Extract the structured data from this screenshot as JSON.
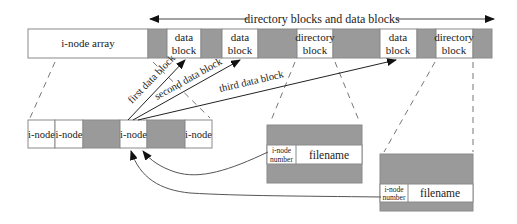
{
  "diagram": {
    "top_arrow_label": "directory blocks and data blocks",
    "colors": {
      "gray_block": "#9a9a9a",
      "stroke": "#7a7a7a",
      "line": "#444444"
    },
    "disk_strip": {
      "segments": [
        {
          "kind": "label",
          "text": "i-node array"
        },
        {
          "kind": "gray"
        },
        {
          "kind": "block",
          "line1": "data",
          "line2": "block"
        },
        {
          "kind": "gray"
        },
        {
          "kind": "block",
          "line1": "data",
          "line2": "block"
        },
        {
          "kind": "gray"
        },
        {
          "kind": "block",
          "line1": "directory",
          "line2": "block"
        },
        {
          "kind": "gray"
        },
        {
          "kind": "block",
          "line1": "data",
          "line2": "block"
        },
        {
          "kind": "gray"
        },
        {
          "kind": "block",
          "line1": "directory",
          "line2": "block"
        },
        {
          "kind": "gray"
        }
      ]
    },
    "inode_array": {
      "cells": [
        "i-node",
        "i-node",
        "",
        "i-node",
        "",
        "i-node"
      ]
    },
    "pointer_labels": {
      "first": "first data block",
      "second": "second data block",
      "third": "third data block"
    },
    "directory_entries": [
      {
        "inode_line1": "i-node",
        "inode_line2": "number",
        "filename": "filename"
      },
      {
        "inode_line1": "i-node",
        "inode_line2": "number",
        "filename": "filename"
      }
    ]
  }
}
